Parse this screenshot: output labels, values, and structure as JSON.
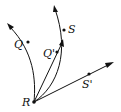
{
  "diagram": {
    "type": "geometric-curves",
    "origin": {
      "label": "R"
    },
    "curves": [
      {
        "name": "curve-to-Q",
        "kind": "curved",
        "point_label": "Q"
      },
      {
        "name": "curve-to-S",
        "kind": "curved",
        "point_label": "S"
      }
    ],
    "rays": [
      {
        "name": "ray-Q-prime",
        "kind": "straight",
        "point_label": "Q'"
      },
      {
        "name": "ray-S-prime",
        "kind": "straight",
        "point_label": "S'"
      }
    ],
    "labels": {
      "R": "R",
      "Q": "Q",
      "S": "S",
      "Q_prime": "Q'",
      "S_prime": "S'"
    },
    "colors": {
      "stroke": "#111111",
      "background": "#ffffff"
    }
  }
}
